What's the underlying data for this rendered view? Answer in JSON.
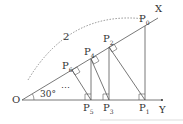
{
  "diagram": {
    "origin": "O",
    "ray_x": "X",
    "ray_y": "Y",
    "angle": "30°",
    "arc_label": "2",
    "ellipsis": "⋯",
    "top_points": [
      {
        "base": "P",
        "sub": "0"
      },
      {
        "base": "P",
        "sub": "2"
      },
      {
        "base": "P",
        "sub": "4"
      },
      {
        "base": "P",
        "sub": "6"
      }
    ],
    "bottom_points": [
      {
        "base": "P",
        "sub": "1"
      },
      {
        "base": "P",
        "sub": "3"
      },
      {
        "base": "P",
        "sub": "5"
      }
    ],
    "colors": {
      "line": "#555555",
      "dotted": "#777777"
    }
  }
}
